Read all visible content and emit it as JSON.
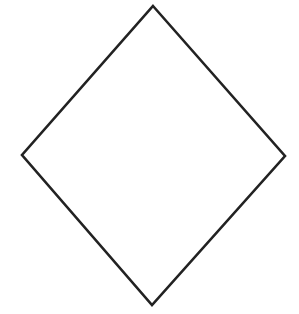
{
  "diagram": {
    "shape": "diamond",
    "background_color": "#ffffff",
    "stroke_color": "#222222",
    "fill_color": "#ffffff",
    "stroke_width": 2.6,
    "vertices": {
      "top": [
        153,
        6
      ],
      "right": [
        285,
        156
      ],
      "bottom": [
        152,
        305
      ],
      "left": [
        22,
        155
      ]
    }
  }
}
